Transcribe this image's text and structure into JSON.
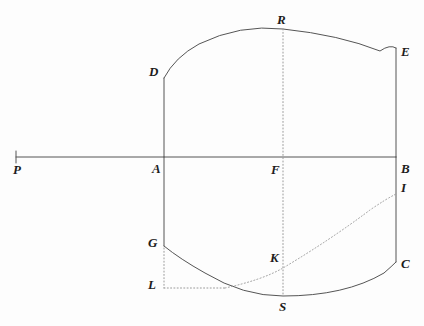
{
  "figure": {
    "background_color": "#fdfdfd",
    "stroke_color": "#555555",
    "dotted_color": "#9a9a9a",
    "label_color": "#1c1c1c",
    "width": 424,
    "height": 326
  },
  "points": [
    {
      "id": "P",
      "label": "P",
      "x": 16,
      "y": 157,
      "label_x": 13,
      "label_y": 163,
      "marked": true
    },
    {
      "id": "A",
      "label": "A",
      "x": 164,
      "y": 157,
      "label_x": 152,
      "label_y": 162,
      "marked": false
    },
    {
      "id": "B",
      "label": "B",
      "x": 396,
      "y": 157,
      "label_x": 401,
      "label_y": 162,
      "marked": false
    },
    {
      "id": "F",
      "label": "F",
      "x": 283,
      "y": 157,
      "label_x": 271,
      "label_y": 163,
      "marked": false
    },
    {
      "id": "D",
      "label": "D",
      "x": 164,
      "y": 78,
      "label_x": 149,
      "label_y": 65,
      "marked": false
    },
    {
      "id": "E",
      "label": "E",
      "x": 396,
      "y": 48,
      "label_x": 401,
      "label_y": 45,
      "marked": false
    },
    {
      "id": "R",
      "label": "R",
      "x": 283,
      "y": 29,
      "label_x": 277,
      "label_y": 13,
      "marked": false
    },
    {
      "id": "G",
      "label": "G",
      "x": 164,
      "y": 246,
      "label_x": 148,
      "label_y": 236,
      "marked": false
    },
    {
      "id": "C",
      "label": "C",
      "x": 396,
      "y": 262,
      "label_x": 401,
      "label_y": 257,
      "marked": false
    },
    {
      "id": "S",
      "label": "S",
      "x": 283,
      "y": 296,
      "label_x": 279,
      "label_y": 300,
      "marked": false
    },
    {
      "id": "L",
      "label": "L",
      "x": 164,
      "y": 288,
      "label_x": 148,
      "label_y": 278,
      "marked": false
    },
    {
      "id": "K",
      "label": "K",
      "x": 283,
      "y": 268,
      "label_x": 270,
      "label_y": 251,
      "marked": false
    },
    {
      "id": "I",
      "label": "I",
      "x": 396,
      "y": 194,
      "label_x": 401,
      "label_y": 181,
      "marked": false
    }
  ],
  "solid_segments": [
    {
      "name": "baseline-PB",
      "from": "P",
      "to": "B",
      "d": "M 16 157 L 396 157"
    },
    {
      "name": "left-vertical-DA",
      "from": "D",
      "to": "A",
      "d": "M 164 78 L 164 157"
    },
    {
      "name": "left-vertical-AG",
      "from": "A",
      "to": "G",
      "d": "M 164 157 L 164 246"
    },
    {
      "name": "right-vertical-EB",
      "from": "E",
      "to": "B",
      "d": "M 396 48 L 396 157"
    },
    {
      "name": "right-vertical-BC",
      "from": "B",
      "to": "C",
      "d": "M 396 157 L 396 262"
    },
    {
      "name": "p-tick",
      "from": "P",
      "to": "P",
      "d": "M 16 151 L 16 163"
    }
  ],
  "solid_arcs": [
    {
      "name": "upper-arc-DRE",
      "from": "D",
      "apex": "R",
      "to": "E",
      "d": "M 164 78 Q 175 57 199 44 Q 240 24 283 29 Q 340 35 380 51 Q 390 44 396 48"
    },
    {
      "name": "lower-arc-GSC",
      "from": "G",
      "apex": "S",
      "to": "C",
      "d": "M 164 246 Q 180 259 205 273 Q 243 296 283 296 Q 345 296 384 273 Q 392 266 396 262"
    }
  ],
  "dotted_segments": [
    {
      "name": "vertical-axis-RF-S",
      "from": "R",
      "to": "S",
      "d": "M 283 29 L 283 296"
    },
    {
      "name": "horizontal-GL-LK",
      "from": "L",
      "to": "K",
      "d": "M 164 288 L 225 288"
    }
  ],
  "dotted_arcs": [
    {
      "name": "curve-LKI",
      "from": "L",
      "through": "K",
      "to": "I",
      "d": "M 225 288 Q 262 280 283 268 Q 330 240 370 210 Q 386 199 396 194"
    }
  ],
  "dotted_verticals": [
    {
      "name": "dotted-GL",
      "from": "G",
      "to": "L",
      "d": "M 164 248 L 164 288"
    }
  ],
  "legend": {
    "solid_label": "solid outline",
    "dotted_label": "construction line"
  }
}
